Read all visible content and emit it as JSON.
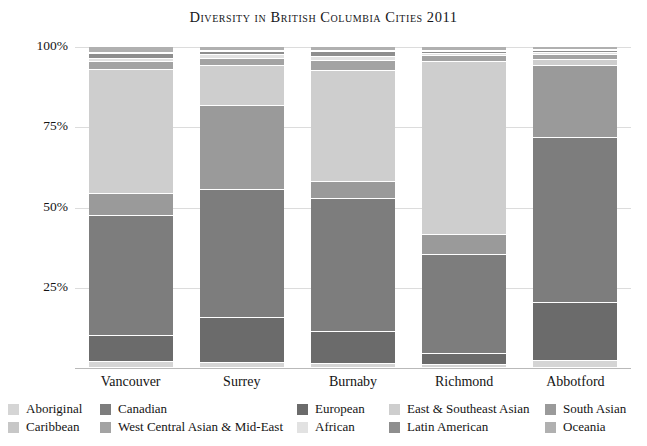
{
  "chart_data": {
    "type": "bar",
    "title": "Diversity in British Columbia Cities 2011",
    "subtype": "stacked-percent",
    "xlabel": "",
    "ylabel": "",
    "ylim": [
      0,
      100
    ],
    "grid": true,
    "legend_position": "bottom",
    "y_ticks": [
      "25%",
      "50%",
      "75%",
      "100%"
    ],
    "y_tick_values": [
      25,
      50,
      75,
      100
    ],
    "categories": [
      "Vancouver",
      "Surrey",
      "Burnaby",
      "Richmond",
      "Abbotford"
    ],
    "series": [
      {
        "name": "Aboriginal",
        "color": "#d5d5d5",
        "values": [
          2.0,
          1.5,
          1.3,
          0.8,
          2.2
        ]
      },
      {
        "name": "Canadian",
        "color": "#7d7d7d",
        "values": [
          37.5,
          40.0,
          41.5,
          31.0,
          51.5
        ]
      },
      {
        "name": "European",
        "color": "#6b6b6b",
        "values": [
          8.0,
          14.0,
          10.0,
          3.5,
          18.0
        ]
      },
      {
        "name": "Caribbean",
        "color": "#c7c7c7",
        "values": [
          0.4,
          0.3,
          0.4,
          0.3,
          0.3
        ]
      },
      {
        "name": "Latin American",
        "color": "#8e8e8e",
        "values": [
          1.3,
          1.0,
          1.4,
          0.7,
          0.8
        ]
      },
      {
        "name": "African",
        "color": "#e2e2e2",
        "values": [
          1.0,
          1.4,
          1.5,
          0.6,
          0.7
        ]
      },
      {
        "name": "West Central Asian & Mid-East",
        "color": "#a3a3a3",
        "values": [
          2.6,
          2.2,
          3.0,
          2.0,
          1.4
        ]
      },
      {
        "name": "South Asian",
        "color": "#9a9a9a",
        "values": [
          6.8,
          26.0,
          5.2,
          6.0,
          22.5
        ]
      },
      {
        "name": "East & Southeast Asian",
        "color": "#cecece",
        "values": [
          38.5,
          12.5,
          34.5,
          54.0,
          1.8
        ]
      },
      {
        "name": "Oceania",
        "color": "#b0b0b0",
        "values": [
          1.9,
          1.1,
          1.2,
          1.1,
          0.8
        ]
      }
    ],
    "stack_order_bottom_to_top": [
      "Aboriginal",
      "European",
      "Canadian",
      "South Asian",
      "East & Southeast Asian",
      "West Central Asian & Mid-East",
      "African",
      "Latin American",
      "Caribbean",
      "Oceania"
    ]
  },
  "legend": {
    "columns": [
      {
        "items": [
          {
            "label": "Aboriginal",
            "color": "#d5d5d5"
          },
          {
            "label": "Caribbean",
            "color": "#c7c7c7"
          }
        ]
      },
      {
        "items": [
          {
            "label": "Canadian",
            "color": "#7d7d7d"
          },
          {
            "label": "West Central Asian & Mid-East",
            "color": "#a3a3a3"
          }
        ]
      },
      {
        "items": [
          {
            "label": "European",
            "color": "#6b6b6b"
          },
          {
            "label": "African",
            "color": "#e2e2e2"
          }
        ]
      },
      {
        "items": [
          {
            "label": "East & Southeast Asian",
            "color": "#cecece"
          },
          {
            "label": "Latin American",
            "color": "#8e8e8e"
          }
        ]
      },
      {
        "items": [
          {
            "label": "South Asian",
            "color": "#9a9a9a"
          },
          {
            "label": "Oceania",
            "color": "#b0b0b0"
          }
        ]
      }
    ]
  },
  "colors": {
    "background": "#ffffff",
    "text": "#141414",
    "gridline": "#dcdcdc",
    "axis": "#b9b9b9"
  }
}
